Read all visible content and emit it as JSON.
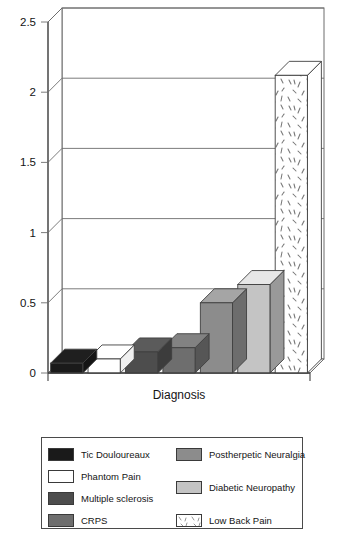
{
  "figure": {
    "caption": ""
  },
  "axes": {
    "y_ticks": [
      "2.5",
      "2",
      "1.5",
      "1",
      "0.5",
      "0"
    ],
    "y_min": 0,
    "y_max": 2.5,
    "x_label": "Diagnosis",
    "y_label": ""
  },
  "legend": {
    "columns": [
      {
        "entries": [
          {
            "label": "Tic Douloureaux",
            "fill": "#1a1a1a",
            "pattern": "solid"
          },
          {
            "label": "Phantom Pain",
            "fill": "#ffffff",
            "pattern": "solid"
          },
          {
            "label": "Multiple sclerosis",
            "fill": "#4d4d4d",
            "pattern": "solid"
          },
          {
            "label": "CRPS",
            "fill": "#6e6e6e",
            "pattern": "solid"
          }
        ]
      },
      {
        "entries": [
          {
            "label": "Postherpetic Neuralgia",
            "fill": "#8c8c8c",
            "pattern": "solid"
          },
          {
            "label": "Diabetic Neuropathy",
            "fill": "#c4c4c4",
            "pattern": "solid"
          },
          {
            "label": "Low Back Pain",
            "fill": "#ffffff",
            "pattern": "speckle"
          }
        ]
      }
    ]
  },
  "chart_data": {
    "type": "bar",
    "title": "",
    "xlabel": "Diagnosis",
    "ylabel": "",
    "ylim": [
      0,
      2.5
    ],
    "yticks": [
      0,
      0.5,
      1,
      1.5,
      2,
      2.5
    ],
    "grid": true,
    "legend_position": "bottom",
    "style": "3d-perspective",
    "categories": [
      "Tic Douloureaux",
      "Phantom Pain",
      "Multiple sclerosis",
      "CRPS",
      "Postherpetic Neuralgia",
      "Diabetic Neuropathy",
      "Low Back Pain"
    ],
    "values": [
      0.07,
      0.1,
      0.15,
      0.18,
      0.5,
      0.63,
      2.12
    ],
    "fills": [
      "#1a1a1a",
      "#ffffff",
      "#4d4d4d",
      "#6e6e6e",
      "#8c8c8c",
      "#c4c4c4",
      "#ffffff"
    ],
    "patterns": [
      "solid",
      "solid",
      "solid",
      "solid",
      "solid",
      "solid",
      "speckle"
    ]
  }
}
